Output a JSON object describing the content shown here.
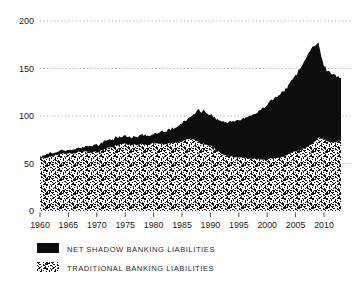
{
  "figure": {
    "background": "#ffffff",
    "text_color": "#1b1b1b",
    "grid_color": "#a0a0a0"
  },
  "chart_data": {
    "type": "area",
    "stacked": true,
    "title": "",
    "xlabel": "",
    "ylabel": "",
    "xlim": [
      1960,
      2013
    ],
    "ylim": [
      0,
      200
    ],
    "x_tick_labels": [
      "1960",
      "1965",
      "1970",
      "1975",
      "1980",
      "1985",
      "1990",
      "1995",
      "2000",
      "2005",
      "2010"
    ],
    "x_ticks": [
      1960,
      1965,
      1970,
      1975,
      1980,
      1985,
      1990,
      1995,
      2000,
      2005,
      2010
    ],
    "y_ticks": [
      0,
      50,
      100,
      150,
      200
    ],
    "grid": "dotted-horizontal",
    "legend_position": "below-left",
    "years": [
      1960,
      1961,
      1962,
      1963,
      1964,
      1965,
      1966,
      1967,
      1968,
      1969,
      1970,
      1971,
      1972,
      1973,
      1974,
      1975,
      1976,
      1977,
      1978,
      1979,
      1980,
      1981,
      1982,
      1983,
      1984,
      1985,
      1986,
      1987,
      1988,
      1989,
      1990,
      1991,
      1992,
      1993,
      1994,
      1995,
      1996,
      1997,
      1998,
      1999,
      2000,
      2001,
      2002,
      2003,
      2004,
      2005,
      2006,
      2007,
      2008,
      2009,
      2010,
      2011,
      2012,
      2013
    ],
    "series": [
      {
        "name": "NET SHADOW BANKING LIABILITIES",
        "fill": "solid",
        "color": "#0d0d0d",
        "values": [
          3,
          3,
          3,
          3,
          4,
          4,
          4,
          5,
          5,
          7,
          8,
          8,
          8,
          8,
          8,
          8,
          8,
          8,
          10,
          10,
          10,
          12,
          14,
          15,
          16,
          19,
          21,
          26,
          34,
          35,
          32,
          33,
          34,
          35,
          37,
          39,
          42,
          45,
          48,
          53,
          58,
          62,
          65,
          69,
          74,
          80,
          87,
          96,
          102,
          100,
          77,
          73,
          70,
          66
        ]
      },
      {
        "name": "TRADITIONAL BANKING LIABILITIES",
        "fill": "stipple",
        "color": "#111111",
        "values": [
          55,
          56,
          58,
          59,
          60,
          61,
          61,
          62,
          63,
          62,
          62,
          64,
          66,
          68,
          70,
          71,
          69,
          70,
          70,
          70,
          71,
          70,
          70,
          71,
          72,
          73,
          75,
          76,
          72,
          70,
          69,
          64,
          60,
          58,
          57,
          57,
          56,
          55,
          55,
          54,
          54,
          55,
          56,
          58,
          60,
          63,
          65,
          67,
          70,
          77,
          75,
          73,
          73,
          74
        ]
      }
    ]
  }
}
